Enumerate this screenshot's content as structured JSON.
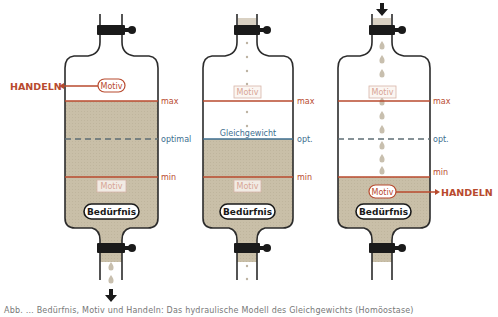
{
  "colors": {
    "liquid": "#c9bfa8",
    "outline": "#2b2b2b",
    "red": "#b84a2e",
    "blue": "#3d6e8f",
    "drop": "#c8bfae",
    "valve": "#1a1a1a"
  },
  "labels": {
    "max": "max",
    "min": "min",
    "optimal": "optimal",
    "opt": "opt.",
    "motiv": "Motiv",
    "beduerfnis": "Bedürfnis",
    "handeln": "HANDELN",
    "gleichgewicht": "Gleichgewicht"
  },
  "bottles": [
    {
      "id": "left",
      "state": "overfull",
      "fill_level": "max",
      "opt_label": "optimal",
      "motiv_position": "top",
      "handeln_direction": "left",
      "flow": "outflow"
    },
    {
      "id": "middle",
      "state": "equilibrium",
      "fill_level": "optimal",
      "opt_label": "opt.",
      "equilibrium_label": "Gleichgewicht",
      "flow": "balanced"
    },
    {
      "id": "right",
      "state": "deficit",
      "fill_level": "min",
      "opt_label": "opt.",
      "motiv_position": "bottom",
      "handeln_direction": "right",
      "flow": "inflow"
    }
  ],
  "caption": "Abb. … Bedürfnis, Motiv und Handeln: Das hydraulische Modell des Gleichgewichts (Homöostase)"
}
